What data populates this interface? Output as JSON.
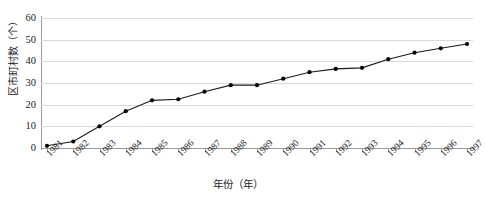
{
  "chart_data": {
    "type": "line",
    "title": "",
    "xlabel": "年份（年）",
    "ylabel": "区市町村数（个）",
    "categories": [
      "1981",
      "1982",
      "1983",
      "1984",
      "1985",
      "1986",
      "1987",
      "1988",
      "1989",
      "1990",
      "1991",
      "1992",
      "1993",
      "1994",
      "1995",
      "1996",
      "1997"
    ],
    "values": [
      1,
      3,
      10,
      17,
      22,
      22.5,
      26,
      29,
      29,
      32,
      35,
      36.5,
      37,
      41,
      44,
      46,
      48
    ],
    "series": [
      {
        "name": "区市町村数",
        "values": [
          1,
          3,
          10,
          17,
          22,
          22.5,
          26,
          29,
          29,
          32,
          35,
          36.5,
          37,
          41,
          44,
          46,
          48
        ]
      }
    ],
    "yticks": [
      0,
      10,
      20,
      30,
      40,
      50,
      60
    ],
    "ylim": [
      0,
      60
    ],
    "xlim": [
      "1981",
      "1997"
    ],
    "grid": "horizontal",
    "legend": "none",
    "marker": "filled-circle",
    "line_color": "#1a1a1a",
    "marker_color": "#000000",
    "grid_color": "#d9d9d9",
    "axis_color": "#9a9a9a"
  },
  "caption": {
    "text": ""
  }
}
